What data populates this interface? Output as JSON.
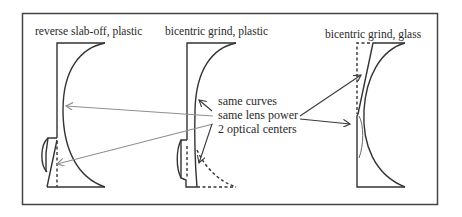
{
  "diagram": {
    "panels": [
      {
        "id": "reverse-slab-off",
        "title": "reverse slab-off, plastic"
      },
      {
        "id": "bicentric-plastic",
        "title": "bicentric grind, plastic"
      },
      {
        "id": "bicentric-glass",
        "title": "bicentric grind, glass"
      }
    ],
    "annotation": {
      "lines": [
        "same curves",
        "same lens power",
        "2 optical centers"
      ]
    },
    "colors": {
      "outline": "#333333",
      "gray_arrows": "#8f8f8f",
      "dark_arrows": "#3a3a3a",
      "frame": "#444444"
    }
  }
}
